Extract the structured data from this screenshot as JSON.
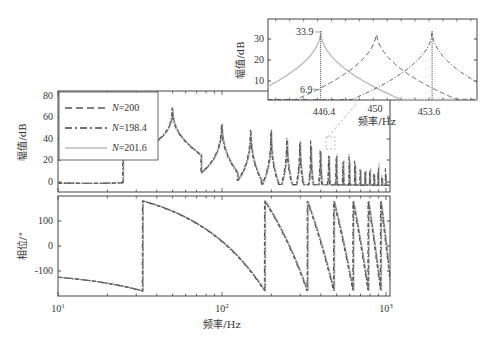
{
  "chart_data": [
    {
      "type": "line",
      "panel": "magnitude",
      "title": "",
      "xlabel": "",
      "ylabel": "幅值/dB",
      "xscale": "log",
      "xlim": [
        10,
        1100
      ],
      "ylim": [
        -10,
        85
      ],
      "yticks": [
        0,
        20,
        40,
        60,
        80
      ],
      "ytick_labels": [
        "0",
        "20",
        "40",
        "60",
        "80"
      ],
      "legend": {
        "position": "upper left",
        "entries": [
          {
            "label": "N=200",
            "style": "dashed",
            "color": "#555555"
          },
          {
            "label": "N=198.4",
            "style": "dash-dot",
            "color": "#444444"
          },
          {
            "label": "N=201.6",
            "style": "solid",
            "color": "#bbbbbb"
          }
        ]
      },
      "series_description": "Resonance peaks at harmonics of ~50 Hz (50, 100, 150 ... ~1000 Hz); baseline ~ -5 to 5 dB, peaks decreasing from ~72 dB at 50 Hz to ~20 dB near 1000 Hz",
      "peaks_hz": [
        50,
        100,
        150,
        200,
        250,
        300,
        350,
        400,
        450,
        500,
        550,
        600,
        650,
        700,
        750,
        800,
        850,
        900,
        950,
        1000
      ],
      "peaks_db": [
        72,
        60,
        55,
        52,
        49,
        46,
        42,
        40,
        37,
        35,
        33,
        31,
        29,
        27,
        26,
        25,
        24,
        23,
        22,
        21
      ],
      "baseline_db": 0
    },
    {
      "type": "line",
      "panel": "phase",
      "xlabel": "频率/Hz",
      "ylabel": "相位/°",
      "xscale": "log",
      "xlim": [
        10,
        1100
      ],
      "ylim": [
        -190,
        190
      ],
      "yticks": [
        -100,
        0,
        100
      ],
      "ytick_labels": [
        "-100",
        "0",
        "100"
      ],
      "xticks": [
        10,
        100,
        1000
      ],
      "xtick_labels": [
        "10",
        "10",
        "10"
      ],
      "xtick_exponents": [
        "1",
        "2",
        "3"
      ],
      "series_description": "Phase wraps between -180° and +180°, jumps at ~25, 50, 75, 100 ... Hz; starts at about -125° at 10 Hz"
    },
    {
      "type": "line",
      "panel": "inset-zoom",
      "xlabel": "频率/Hz",
      "ylabel": "幅值/dB",
      "xlim": [
        443,
        456.5
      ],
      "ylim": [
        0,
        38
      ],
      "xticks": [
        446.4,
        450,
        453.6
      ],
      "xtick_labels": [
        "446.4",
        "450",
        "453.6"
      ],
      "yticks": [
        10,
        20,
        30
      ],
      "ytick_labels": [
        "10",
        "20",
        "30"
      ],
      "series": [
        {
          "name": "N=201.6",
          "style": "solid",
          "peak_hz": 446.4,
          "peak_db": 33.9
        },
        {
          "name": "N=200",
          "style": "dashed",
          "peak_hz": 450,
          "peak_db": 33.9
        },
        {
          "name": "N=198.4",
          "style": "dash-dot",
          "peak_hz": 453.6,
          "peak_db": 33.9
        }
      ],
      "annotations": [
        {
          "text": "33.9",
          "x": 446.4,
          "y": 33.9
        },
        {
          "text": "6.9",
          "x": 446.4,
          "y": 6.9
        }
      ]
    }
  ],
  "labels": {
    "mag_ylabel": "幅值/dB",
    "phase_ylabel": "相位/°",
    "xlabel": "频率/Hz",
    "inset_ylabel": "幅值/dB",
    "inset_xlabel": "频率/Hz",
    "legend_n": "N",
    "legend_1": "=200",
    "legend_2": "=198.4",
    "legend_3": "=201.6",
    "mag_ticks": [
      "80",
      "60",
      "40",
      "20",
      "0"
    ],
    "phase_ticks": [
      "100",
      "0",
      "-100"
    ],
    "x_base": "10",
    "x_exp": [
      "1",
      "2",
      "3"
    ],
    "inset_yticks": [
      "30",
      "20",
      "10"
    ],
    "inset_xticks": [
      "446.4",
      "450",
      "453.6"
    ],
    "ann_peak": "33.9",
    "ann_cross": "6.9"
  }
}
